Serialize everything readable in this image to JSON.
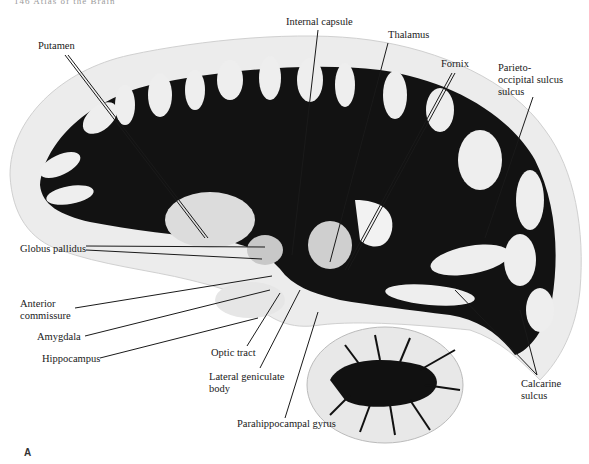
{
  "header": {
    "text": "146  Atlas of the Brain"
  },
  "figure": {
    "panel_letter": "A",
    "colors": {
      "white_matter": "#111111",
      "gray_matter": "#eeeeee",
      "background": "#ffffff",
      "leader_lines": "#1a1a1a"
    }
  },
  "labels": {
    "putamen": "Putamen",
    "internal_capsule": "Internal capsule",
    "thalamus": "Thalamus",
    "fornix": "Fornix",
    "parieto_1": "Parieto-",
    "parieto_2": "occipital sulcus",
    "parieto_3": "sulcus",
    "globus_pallidus": "Globus pallidus",
    "anterior_1": "Anterior",
    "anterior_2": "commissure",
    "amygdala": "Amygdala",
    "hippocampus": "Hippocampus",
    "optic_tract": "Optic tract",
    "lgb_1": "Lateral geniculate",
    "lgb_2": "body",
    "parahippocampal": "Parahippocampal gyrus",
    "calcarine_1": "Calcarine",
    "calcarine_2": "sulcus"
  }
}
